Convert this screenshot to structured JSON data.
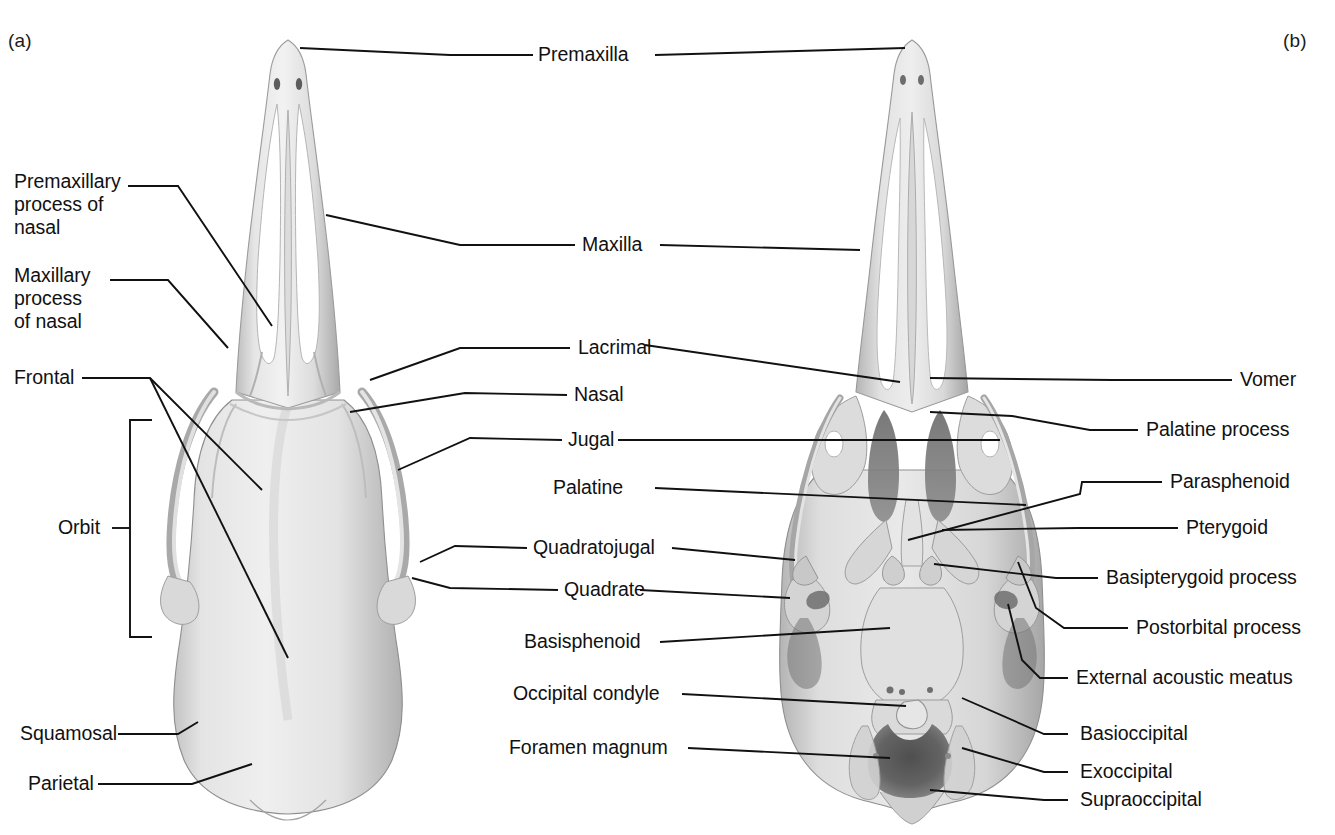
{
  "figure": {
    "background_color": "#ffffff",
    "line_color": "#111111",
    "text_color": "#111111",
    "bone_light": "#e9e9e9",
    "bone_mid": "#c9c9c9",
    "bone_shadow": "#9a9a9a",
    "cavity_dark": "#6a6a6a"
  },
  "panels": [
    {
      "key": "a",
      "label": "(a)",
      "view": "dorsal"
    },
    {
      "key": "b",
      "label": "(b)",
      "view": "ventral"
    }
  ],
  "labels": {
    "left_column": [
      {
        "id": "premaxillary-process-of-nasal",
        "text": "Premaxillary\nprocess of\nnasal"
      },
      {
        "id": "maxillary-process-of-nasal",
        "text": "Maxillary\nprocess\nof nasal"
      },
      {
        "id": "frontal",
        "text": "Frontal"
      },
      {
        "id": "orbit",
        "text": "Orbit"
      },
      {
        "id": "squamosal",
        "text": "Squamosal"
      },
      {
        "id": "parietal",
        "text": "Parietal"
      }
    ],
    "center_column": [
      {
        "id": "premaxilla",
        "text": "Premaxilla"
      },
      {
        "id": "maxilla",
        "text": "Maxilla"
      },
      {
        "id": "lacrimal",
        "text": "Lacrimal"
      },
      {
        "id": "nasal",
        "text": "Nasal"
      },
      {
        "id": "jugal",
        "text": "Jugal"
      },
      {
        "id": "palatine",
        "text": "Palatine"
      },
      {
        "id": "quadratojugal",
        "text": "Quadratojugal"
      },
      {
        "id": "quadrate",
        "text": "Quadrate"
      },
      {
        "id": "basisphenoid",
        "text": "Basisphenoid"
      },
      {
        "id": "occipital-condyle",
        "text": "Occipital condyle"
      },
      {
        "id": "foramen-magnum",
        "text": "Foramen magnum"
      }
    ],
    "right_column": [
      {
        "id": "vomer",
        "text": "Vomer"
      },
      {
        "id": "palatine-process",
        "text": "Palatine process"
      },
      {
        "id": "parasphenoid",
        "text": "Parasphenoid"
      },
      {
        "id": "pterygoid",
        "text": "Pterygoid"
      },
      {
        "id": "basipterygoid-process",
        "text": "Basipterygoid process"
      },
      {
        "id": "postorbital-process",
        "text": "Postorbital process"
      },
      {
        "id": "external-acoustic-meatus",
        "text": "External acoustic meatus"
      },
      {
        "id": "basioccipital",
        "text": "Basioccipital"
      },
      {
        "id": "exoccipital",
        "text": "Exoccipital"
      },
      {
        "id": "supraoccipital",
        "text": "Supraoccipital"
      }
    ]
  }
}
